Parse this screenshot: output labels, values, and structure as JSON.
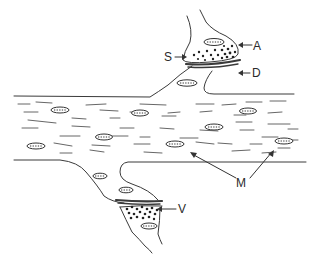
{
  "diagram": {
    "type": "neuron-synapse-illustration",
    "colors": {
      "stroke": "#3a3a3a",
      "background": "#ffffff",
      "dots": "#222222"
    },
    "labels": {
      "A": {
        "text": "A",
        "x": 255,
        "y": 40
      },
      "S": {
        "text": "S",
        "x": 165,
        "y": 54
      },
      "D": {
        "text": "D",
        "x": 252,
        "y": 70
      },
      "M": {
        "text": "M",
        "x": 234,
        "y": 181
      },
      "V": {
        "text": "V",
        "x": 180,
        "y": 205
      }
    },
    "elements": [
      {
        "id": "axon-process",
        "description": "horizontal axon/dendrite shaft with scattered mitochondria"
      },
      {
        "id": "upper-synaptic-terminal",
        "label": "A",
        "description": "upper bouton with vesicles"
      },
      {
        "id": "synaptic-cleft-top",
        "label": "S"
      },
      {
        "id": "dendrite-spine-top",
        "label": "D"
      },
      {
        "id": "lower-synaptic-terminal",
        "label": "V",
        "description": "lower bouton with vesicles"
      },
      {
        "id": "mitochondria",
        "label": "M"
      }
    ]
  }
}
